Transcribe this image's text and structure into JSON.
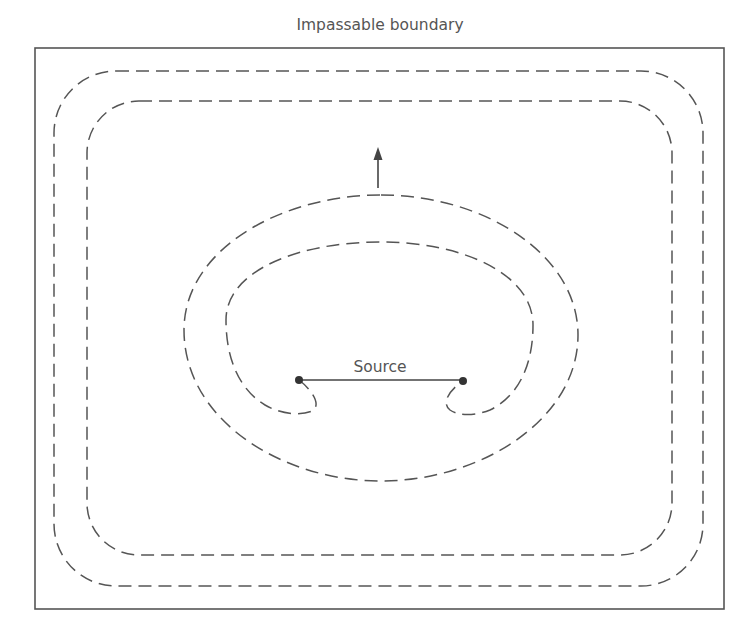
{
  "diagram": {
    "title": "Impassable boundary",
    "source_label": "Source",
    "colors": {
      "line": "#555555",
      "text": "#555555",
      "dot": "#333333",
      "background": "#ffffff"
    },
    "elements": {
      "boundary": {
        "x": 35,
        "y": 48,
        "width": 689,
        "height": 561
      },
      "outer_rect_contour": {
        "x": 54,
        "y": 71,
        "width": 649,
        "height": 515,
        "corner_radius": 62
      },
      "inner_rect_contour": {
        "x": 87,
        "y": 101,
        "width": 585,
        "height": 454,
        "corner_radius": 52
      },
      "outer_ellipse_contour": {
        "cx": 381,
        "top": 195,
        "bottom": 481,
        "left": 184,
        "right": 578
      },
      "inner_ellipse_contour": {
        "cx": 380,
        "top": 242,
        "left": 226,
        "right": 533,
        "curl_bottom": 413
      },
      "source_segment": {
        "x1": 299,
        "y1": 380,
        "x2": 463,
        "y2": 380
      },
      "expansion_arrow": {
        "x": 378,
        "tip_y": 148,
        "tail_y": 188,
        "direction": "up"
      }
    }
  }
}
